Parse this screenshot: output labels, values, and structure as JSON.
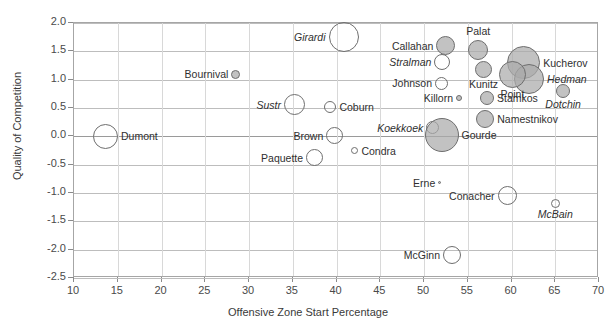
{
  "chart_data": {
    "type": "scatter",
    "title": "",
    "xlabel": "Offensive Zone Start Percentage",
    "ylabel": "Quality of Competition",
    "xlim": [
      10,
      70
    ],
    "ylim": [
      -2.5,
      2.0
    ],
    "xticks": [
      10,
      15,
      20,
      25,
      30,
      35,
      40,
      45,
      50,
      55,
      60,
      65,
      70
    ],
    "yticks": [
      2.0,
      1.5,
      1.0,
      0.5,
      0.0,
      -0.5,
      -1.0,
      -1.5,
      -2.0,
      -2.5
    ],
    "ytick_labels": [
      "2.0",
      "1.5",
      "1.0",
      "0.5",
      "0.0",
      "-0.5",
      "-1.0",
      "-1.5",
      "-2.0",
      "-2.5"
    ],
    "xtick_labels": [
      "10",
      "15",
      "20",
      "25",
      "30",
      "35",
      "40",
      "45",
      "50",
      "55",
      "60",
      "65",
      "70"
    ],
    "grid": "horizontal-and-vertical-light",
    "legend": "none",
    "size_encoding": "bubble-area = time on ice",
    "points": [
      {
        "label": "Dumont",
        "x": 13.6,
        "y": 0.0,
        "size": 25,
        "fill": "open",
        "italic": false,
        "label_pos": "right"
      },
      {
        "label": "Bournival",
        "x": 28.5,
        "y": 1.1,
        "size": 9,
        "fill": "filled",
        "italic": false,
        "label_pos": "left"
      },
      {
        "label": "Girardi",
        "x": 40.8,
        "y": 1.75,
        "size": 30,
        "fill": "open",
        "italic": true,
        "label_pos": "left"
      },
      {
        "label": "Sustr",
        "x": 35.2,
        "y": 0.56,
        "size": 21,
        "fill": "open",
        "italic": true,
        "label_pos": "left"
      },
      {
        "label": "Coburn",
        "x": 39.3,
        "y": 0.52,
        "size": 12,
        "fill": "open",
        "italic": false,
        "label_pos": "right"
      },
      {
        "label": "Brown",
        "x": 39.8,
        "y": 0.01,
        "size": 17,
        "fill": "open",
        "italic": false,
        "label_pos": "left"
      },
      {
        "label": "Paquette",
        "x": 37.5,
        "y": -0.38,
        "size": 17,
        "fill": "open",
        "italic": false,
        "label_pos": "left"
      },
      {
        "label": "Condra",
        "x": 42.1,
        "y": -0.25,
        "size": 7,
        "fill": "open",
        "italic": false,
        "label_pos": "right"
      },
      {
        "label": "Callahan",
        "x": 52.5,
        "y": 1.6,
        "size": 19,
        "fill": "filled",
        "italic": false,
        "label_pos": "left"
      },
      {
        "label": "Palat",
        "x": 56.2,
        "y": 1.52,
        "size": 20,
        "fill": "filled",
        "italic": false,
        "label_pos": "above"
      },
      {
        "label": "Stralman",
        "x": 52.1,
        "y": 1.32,
        "size": 16,
        "fill": "open",
        "italic": true,
        "label_pos": "left"
      },
      {
        "label": "Johnson",
        "x": 52.0,
        "y": 0.94,
        "size": 13,
        "fill": "open",
        "italic": false,
        "label_pos": "left"
      },
      {
        "label": "Kunitz",
        "x": 56.8,
        "y": 1.18,
        "size": 17,
        "fill": "filled",
        "italic": false,
        "label_pos": "below"
      },
      {
        "label": "Kucherov",
        "x": 61.4,
        "y": 1.3,
        "size": 33,
        "fill": "filled",
        "italic": false,
        "label_pos": "right"
      },
      {
        "label": "Hedman",
        "x": 62.0,
        "y": 1.02,
        "size": 30,
        "fill": "filled",
        "italic": true,
        "label_pos": "right"
      },
      {
        "label": "Point",
        "x": 60.1,
        "y": 1.1,
        "size": 27,
        "fill": "filled",
        "italic": false,
        "label_pos": "below"
      },
      {
        "label": "Dotchin",
        "x": 65.9,
        "y": 0.8,
        "size": 14,
        "fill": "filled",
        "italic": true,
        "label_pos": "below"
      },
      {
        "label": "Killorn",
        "x": 54.0,
        "y": 0.68,
        "size": 6,
        "fill": "filled",
        "italic": false,
        "label_pos": "left"
      },
      {
        "label": "Stamkos",
        "x": 57.2,
        "y": 0.68,
        "size": 14,
        "fill": "filled",
        "italic": false,
        "label_pos": "right"
      },
      {
        "label": "Namestnikov",
        "x": 57.0,
        "y": 0.3,
        "size": 18,
        "fill": "filled",
        "italic": false,
        "label_pos": "right"
      },
      {
        "label": "Koekkoek",
        "x": 51.0,
        "y": 0.15,
        "size": 13,
        "fill": "open",
        "italic": true,
        "label_pos": "left"
      },
      {
        "label": "Gourde",
        "x": 52.0,
        "y": 0.03,
        "size": 34,
        "fill": "filled",
        "italic": false,
        "label_pos": "right"
      },
      {
        "label": "Erne",
        "x": 51.8,
        "y": -0.82,
        "size": 3,
        "fill": "filled",
        "italic": false,
        "label_pos": "left"
      },
      {
        "label": "Conacher",
        "x": 59.5,
        "y": -1.05,
        "size": 19,
        "fill": "open",
        "italic": false,
        "label_pos": "left"
      },
      {
        "label": "McBain",
        "x": 65.0,
        "y": -1.18,
        "size": 9,
        "fill": "open",
        "italic": true,
        "label_pos": "below"
      },
      {
        "label": "McGinn",
        "x": 53.2,
        "y": -2.1,
        "size": 18,
        "fill": "open",
        "italic": false,
        "label_pos": "left"
      }
    ]
  }
}
